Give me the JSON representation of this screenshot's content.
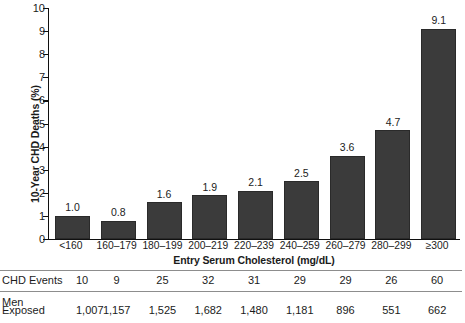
{
  "chart_data": {
    "type": "bar",
    "title": "",
    "xlabel": "Entry Serum Cholesterol (mg/dL)",
    "ylabel": "10-Year CHD Deaths (%)",
    "categories": [
      "<160",
      "160–179",
      "180–199",
      "200–219",
      "220–239",
      "240–259",
      "260–279",
      "280–299",
      "≥300"
    ],
    "values": [
      1.0,
      0.8,
      1.6,
      1.9,
      2.1,
      2.5,
      3.6,
      4.7,
      9.1
    ],
    "value_labels": [
      "1.0",
      "0.8",
      "1.6",
      "1.9",
      "2.1",
      "2.5",
      "3.6",
      "4.7",
      "9.1"
    ],
    "ylim": [
      0,
      10
    ],
    "ytick_labels": [
      "0",
      "1",
      "2",
      "3",
      "4",
      "5",
      "6",
      "7",
      "8",
      "9",
      "10"
    ],
    "yticks": [
      0,
      1,
      2,
      3,
      4,
      5,
      6,
      7,
      8,
      9,
      10
    ],
    "grid": false,
    "legend": null,
    "bar_color": "#3b3b3b",
    "axis_color": "#101010"
  },
  "table": {
    "rows": [
      {
        "label": "CHD Events",
        "values": [
          "10",
          "9",
          "25",
          "32",
          "31",
          "29",
          "29",
          "26",
          "60"
        ]
      },
      {
        "label": "Men\nExposed",
        "label_line1": "Men",
        "label_line2": "Exposed",
        "values": [
          "1,007",
          "1,157",
          "1,525",
          "1,682",
          "1,480",
          "1,181",
          "896",
          "551",
          "662"
        ]
      }
    ]
  }
}
